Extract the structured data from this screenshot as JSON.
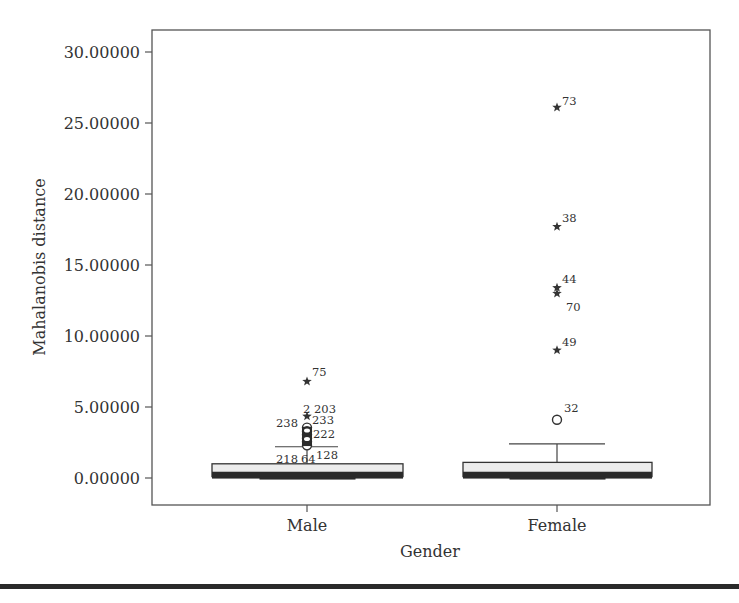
{
  "chart_data": {
    "type": "boxplot",
    "title": "",
    "xlabel": "Gender",
    "ylabel": "Mahalanobis distance",
    "ylim": [
      0,
      30
    ],
    "yticks": [
      0,
      5,
      10,
      15,
      20,
      25,
      30
    ],
    "ytick_labels": [
      "0.00000",
      "5.00000",
      "10.00000",
      "15.00000",
      "20.00000",
      "25.00000",
      "30.00000"
    ],
    "categories": [
      "Male",
      "Female"
    ],
    "grid": false,
    "legend": null,
    "series": [
      {
        "name": "Male",
        "min": 0.05,
        "q1": 0.1,
        "median": 0.3,
        "q3": 1.0,
        "whisker_high": 2.2,
        "outliers": [
          {
            "id": "75",
            "value": 6.8,
            "type": "extreme"
          },
          {
            "id": "2",
            "value": 4.5,
            "type": "extreme"
          },
          {
            "id": "203",
            "value": 4.5,
            "type": "extreme"
          },
          {
            "id": "233",
            "value": 4.3,
            "type": "extreme"
          },
          {
            "id": "238",
            "value": 3.5,
            "type": "outlier"
          },
          {
            "id": "222",
            "value": 3.1,
            "type": "outlier"
          },
          {
            "id": "",
            "value": 3.3,
            "type": "outlier"
          },
          {
            "id": "",
            "value": 2.8,
            "type": "outlier"
          },
          {
            "id": "",
            "value": 2.6,
            "type": "outlier"
          },
          {
            "id": "218",
            "value": 2.3,
            "type": "outlier"
          },
          {
            "id": "64",
            "value": 2.25,
            "type": "outlier"
          },
          {
            "id": "128",
            "value": 2.2,
            "type": "outlier"
          }
        ]
      },
      {
        "name": "Female",
        "min": 0.05,
        "q1": 0.1,
        "median": 0.3,
        "q3": 1.1,
        "whisker_high": 2.4,
        "outliers": [
          {
            "id": "73",
            "value": 26.1,
            "type": "extreme"
          },
          {
            "id": "38",
            "value": 17.7,
            "type": "extreme"
          },
          {
            "id": "44",
            "value": 13.4,
            "type": "extreme"
          },
          {
            "id": "70",
            "value": 13.0,
            "type": "extreme"
          },
          {
            "id": "49",
            "value": 9.0,
            "type": "extreme"
          },
          {
            "id": "32",
            "value": 4.1,
            "type": "outlier"
          }
        ]
      }
    ]
  },
  "labels": {
    "ylabel": "Mahalanobis distance",
    "xlabel": "Gender",
    "cat_male": "Male",
    "cat_female": "Female"
  }
}
